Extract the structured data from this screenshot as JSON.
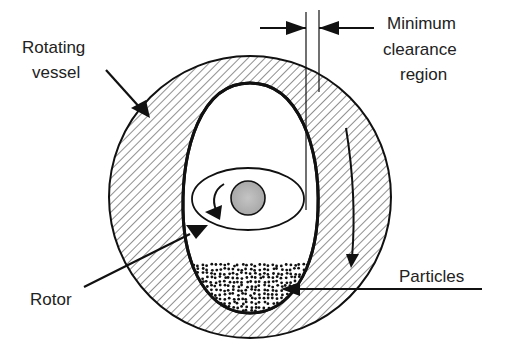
{
  "diagram": {
    "labels": {
      "rotating_vessel_line1": "Rotating",
      "rotating_vessel_line2": "vessel",
      "min_clearance_line1": "Minimum",
      "min_clearance_line2": "clearance",
      "min_clearance_line3": "region",
      "rotor": "Rotor",
      "particles": "Particles"
    },
    "colors": {
      "stroke": "#111111",
      "rotor_fill": "#b8b8b8",
      "background": "#ffffff"
    }
  }
}
